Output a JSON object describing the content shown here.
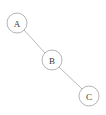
{
  "diagram": {
    "type": "tree",
    "canvas": {
      "width": 106,
      "height": 115,
      "background": "#ffffff"
    },
    "style": {
      "node_fill": "#ffffff",
      "node_stroke": "#b5b5b5",
      "edge_stroke": "#b9b9b9",
      "label_color": "#3a3a3a",
      "node_radius": 10,
      "stroke_width": 1,
      "label_font_size": 9
    },
    "nodes": [
      {
        "id": "A",
        "label": "A",
        "cx": 17,
        "cy": 23,
        "r": 10
      },
      {
        "id": "B",
        "label": "B",
        "cx": 52,
        "cy": 60,
        "r": 10
      },
      {
        "id": "C",
        "label": "C",
        "cx": 89,
        "cy": 96,
        "r": 10
      }
    ],
    "edges": [
      {
        "id": "A-B",
        "from": "A",
        "to": "B",
        "x1": 24,
        "y1": 30,
        "x2": 45,
        "y2": 53
      },
      {
        "id": "B-C",
        "from": "B",
        "to": "C",
        "x1": 59,
        "y1": 67,
        "x2": 82,
        "y2": 89
      }
    ]
  }
}
